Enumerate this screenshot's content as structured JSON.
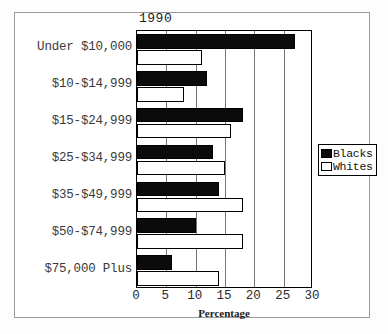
{
  "chart_data": {
    "type": "bar",
    "orientation": "horizontal",
    "title": "1990",
    "xlabel": "Percentage",
    "ylabel": "",
    "xlim": [
      0,
      30
    ],
    "xticks": [
      0,
      5,
      10,
      15,
      20,
      25,
      30
    ],
    "grid": true,
    "legend_position": "right",
    "categories": [
      "Under $10,000",
      "$10-$14,999",
      "$15-$24,999",
      "$25-$34,999",
      "$35-$49,999",
      "$50-$74,999",
      "$75,000 Plus"
    ],
    "series": [
      {
        "name": "Blacks",
        "color": "#0b0b0b",
        "values": [
          27,
          12,
          18,
          13,
          14,
          10,
          6
        ]
      },
      {
        "name": "Whites",
        "color": "#ffffff",
        "values": [
          11,
          8,
          16,
          15,
          18,
          18,
          14
        ]
      }
    ]
  },
  "legend": {
    "items": [
      {
        "label": "Blacks",
        "swatch": "black"
      },
      {
        "label": "Whites",
        "swatch": "white"
      }
    ]
  }
}
